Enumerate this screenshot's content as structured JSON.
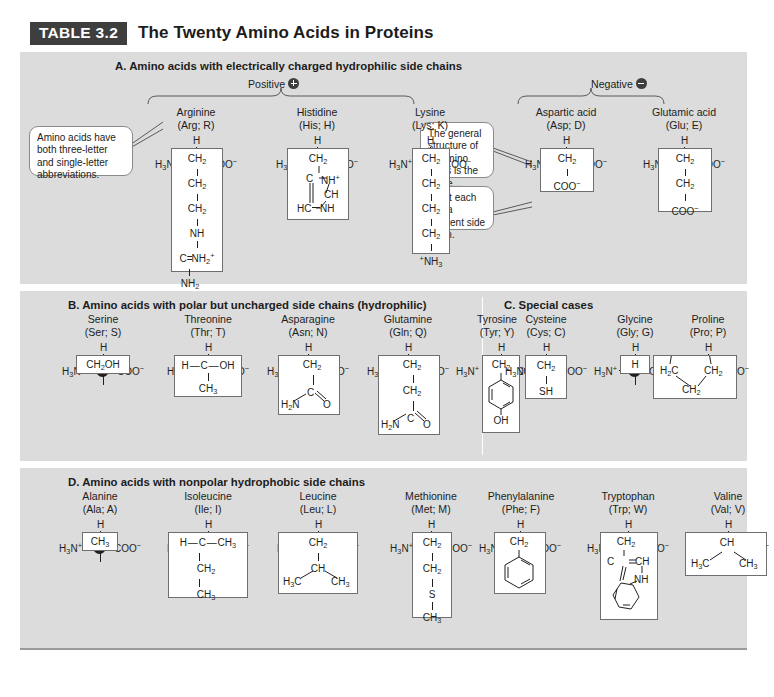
{
  "title": {
    "tag": "TABLE 3.2",
    "text": "The Twenty Amino Acids in Proteins"
  },
  "callouts": {
    "abbrev": "Amino acids have both three-letter and single-letter abbreviations.",
    "general": "The general structure of all amino acids is the same…",
    "sidechain": "…but each has a different side chain."
  },
  "backbone": {
    "h": "H",
    "amino": "H3N+",
    "carboxyl": "COO−"
  },
  "sections": [
    {
      "id": "A",
      "heading": "A.  Amino acids with electrically charged hydrophilic side chains",
      "polarity_labels": [
        {
          "label": "Positive",
          "sign": "+"
        },
        {
          "label": "Negative",
          "sign": "−"
        }
      ],
      "amino_acids": [
        {
          "name": "Arginine",
          "abbr": "(Arg; R)",
          "side_chain": [
            "CH2",
            "CH2",
            "CH2",
            "NH",
            "C=NH2+",
            "NH2"
          ]
        },
        {
          "name": "Histidine",
          "abbr": "(His; H)",
          "side_chain": [
            "CH2",
            "C—NH+",
            "CH",
            "HC—NH"
          ]
        },
        {
          "name": "Lysine",
          "abbr": "(Lys; K)",
          "side_chain": [
            "CH2",
            "CH2",
            "CH2",
            "CH2",
            "+NH3"
          ]
        },
        {
          "name": "Aspartic acid",
          "abbr": "(Asp; D)",
          "side_chain": [
            "CH2",
            "COO−"
          ]
        },
        {
          "name": "Glutamic acid",
          "abbr": "(Glu; E)",
          "side_chain": [
            "CH2",
            "CH2",
            "COO−"
          ]
        }
      ]
    },
    {
      "id": "B",
      "heading": "B.  Amino acids with polar but uncharged side chains (hydrophilic)",
      "amino_acids": [
        {
          "name": "Serine",
          "abbr": "(Ser; S)",
          "side_chain": [
            "CH2OH"
          ]
        },
        {
          "name": "Threonine",
          "abbr": "(Thr; T)",
          "side_chain": [
            "H—C—OH",
            "CH3"
          ]
        },
        {
          "name": "Asparagine",
          "abbr": "(Asn; N)",
          "side_chain": [
            "CH2",
            "C",
            "H2N",
            "O"
          ]
        },
        {
          "name": "Glutamine",
          "abbr": "(Gln; Q)",
          "side_chain": [
            "CH2",
            "CH2",
            "C",
            "H2N",
            "O"
          ]
        },
        {
          "name": "Tyrosine",
          "abbr": "(Tyr; Y)",
          "side_chain": [
            "CH2",
            "benzene-ring",
            "OH"
          ]
        }
      ]
    },
    {
      "id": "C",
      "heading": "C.  Special cases",
      "amino_acids": [
        {
          "name": "Cysteine",
          "abbr": "(Cys; C)",
          "side_chain": [
            "CH2",
            "SH"
          ]
        },
        {
          "name": "Glycine",
          "abbr": "(Gly; G)",
          "side_chain": [
            "H"
          ]
        },
        {
          "name": "Proline",
          "abbr": "(Pro; P)",
          "side_chain": [
            "H2C",
            "CH2",
            "CH2"
          ]
        }
      ]
    },
    {
      "id": "D",
      "heading": "D.  Amino acids with nonpolar hydrophobic side chains",
      "amino_acids": [
        {
          "name": "Alanine",
          "abbr": "(Ala; A)",
          "side_chain": [
            "CH3"
          ]
        },
        {
          "name": "Isoleucine",
          "abbr": "(Ile; I)",
          "side_chain": [
            "H—C—CH3",
            "CH2",
            "CH3"
          ]
        },
        {
          "name": "Leucine",
          "abbr": "(Leu; L)",
          "side_chain": [
            "CH2",
            "CH",
            "H3C",
            "CH3"
          ]
        },
        {
          "name": "Methionine",
          "abbr": "(Met; M)",
          "side_chain": [
            "CH2",
            "CH2",
            "S",
            "CH3"
          ]
        },
        {
          "name": "Phenylalanine",
          "abbr": "(Phe; F)",
          "side_chain": [
            "CH2",
            "benzene-ring"
          ]
        },
        {
          "name": "Tryptophan",
          "abbr": "(Trp; W)",
          "side_chain": [
            "CH2",
            "C=CH",
            "NH",
            "benzene-ring"
          ]
        },
        {
          "name": "Valine",
          "abbr": "(Val; V)",
          "side_chain": [
            "CH",
            "H3C",
            "CH3"
          ]
        }
      ]
    }
  ],
  "colors": {
    "panel": "#dcdcdc",
    "tag_bg": "#3e3e3e",
    "ink": "#231f20",
    "box_border": "#6f6f6f"
  }
}
